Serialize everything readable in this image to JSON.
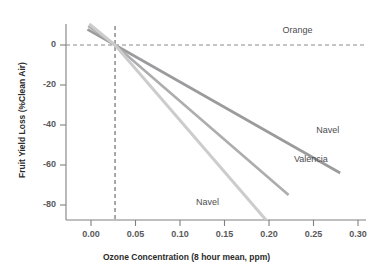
{
  "chart_data": {
    "type": "line",
    "title": "",
    "xlabel": "Ozone Concentration (8 hour mean, ppm)",
    "ylabel": "Fruit Yield Loss (%Clean Air)",
    "xlim": [
      -0.017,
      0.308
    ],
    "ylim": [
      -92,
      10
    ],
    "xticks": [
      "0.00",
      "0.05",
      "0.10",
      "0.15",
      "0.20",
      "0.25",
      "0.30"
    ],
    "xtick_values": [
      0.0,
      0.05,
      0.1,
      0.15,
      0.2,
      0.25,
      0.3
    ],
    "yticks": [
      "0",
      "-20",
      "-40",
      "-60",
      "-80"
    ],
    "ytick_values": [
      0,
      -20,
      -40,
      -60,
      -80
    ],
    "grid": false,
    "legend_position": "inline-annotations",
    "reference_lines": [
      {
        "name": "Orange",
        "orientation": "horizontal",
        "value": 0,
        "style": "dashed",
        "color": "#8c8c8e",
        "label": "Orange"
      },
      {
        "name": "clean-air-threshold",
        "orientation": "vertical",
        "value": 0.027,
        "style": "dashed",
        "color": "#6e6e70",
        "label": ""
      }
    ],
    "series": [
      {
        "name": "Navel",
        "label": "Navel",
        "color": "#9b9b9d",
        "width": 2.6,
        "x": [
          -0.004,
          0.027,
          0.28
        ],
        "y": [
          7.8,
          0,
          -64
        ]
      },
      {
        "name": "Valencia",
        "label": "Valencia",
        "color": "#adadaf",
        "width": 2.6,
        "x": [
          -0.003,
          0.027,
          0.222
        ],
        "y": [
          9.5,
          0,
          -75
        ]
      },
      {
        "name": "Navel (sensitive)",
        "label": "Navel",
        "color": "#cccccd",
        "width": 3.0,
        "x": [
          -0.002,
          0.027,
          0.2015
        ],
        "y": [
          10.5,
          0,
          -90
        ]
      }
    ],
    "annotations": [
      {
        "text": "Orange",
        "x": 0.215,
        "y": 7.0,
        "series": "Orange"
      },
      {
        "text": "Navel",
        "x": 0.253,
        "y": -43.0,
        "series": "Navel"
      },
      {
        "text": "Valencia",
        "x": 0.228,
        "y": -57.5,
        "series": "Valencia"
      },
      {
        "text": "Navel",
        "x": 0.118,
        "y": -79.0,
        "series": "Navel (sensitive)"
      }
    ]
  },
  "axis": {
    "spine_color": "#808082",
    "tick_color": "#808082",
    "background": "#ffffff"
  }
}
